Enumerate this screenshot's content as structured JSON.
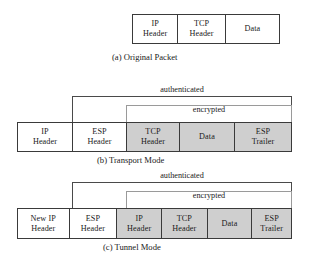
{
  "figure": {
    "sections": [
      {
        "id": "a",
        "caption": "(a) Original Packet",
        "fields": [
          {
            "line1": "IP",
            "line2": "Header",
            "shaded": false
          },
          {
            "line1": "TCP",
            "line2": "Header",
            "shaded": false
          },
          {
            "line1": "Data",
            "line2": "",
            "shaded": false
          }
        ],
        "spans": []
      },
      {
        "id": "b",
        "caption": "(b) Transport Mode",
        "fields": [
          {
            "line1": "IP",
            "line2": "Header",
            "shaded": false
          },
          {
            "line1": "ESP",
            "line2": "Header",
            "shaded": false
          },
          {
            "line1": "TCP",
            "line2": "Header",
            "shaded": true
          },
          {
            "line1": "Data",
            "line2": "",
            "shaded": true
          },
          {
            "line1": "ESP",
            "line2": "Trailer",
            "shaded": true
          }
        ],
        "spans": [
          {
            "label": "authenticated",
            "shaded_label": false
          },
          {
            "label": "encrypted",
            "shaded_label": true
          }
        ]
      },
      {
        "id": "c",
        "caption": "(c) Tunnel Mode",
        "fields": [
          {
            "line1": "New IP",
            "line2": "Header",
            "shaded": false
          },
          {
            "line1": "ESP",
            "line2": "Header",
            "shaded": false
          },
          {
            "line1": "IP",
            "line2": "Header",
            "shaded": true
          },
          {
            "line1": "TCP",
            "line2": "Header",
            "shaded": true
          },
          {
            "line1": "Data",
            "line2": "",
            "shaded": true
          },
          {
            "line1": "ESP",
            "line2": "Trailer",
            "shaded": true
          }
        ],
        "spans": [
          {
            "label": "authenticated",
            "shaded_label": false
          },
          {
            "label": "encrypted",
            "shaded_label": true
          }
        ]
      }
    ],
    "colors": {
      "shaded_field": "#cfcfcf",
      "border": "#3a3a3a",
      "background": "#ffffff",
      "text": "#1a1a1a"
    }
  }
}
